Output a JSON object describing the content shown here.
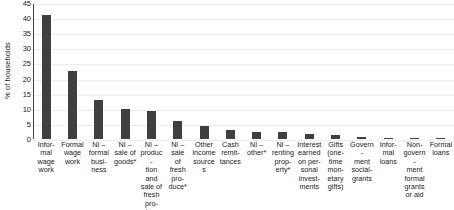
{
  "chart_data": {
    "type": "bar",
    "title": "",
    "xlabel": "",
    "ylabel": "% of households",
    "ylim": [
      0,
      45
    ],
    "yticks": [
      0,
      5,
      10,
      15,
      20,
      25,
      30,
      35,
      40,
      45
    ],
    "grid": true,
    "legend": "none",
    "bar_color": "#3f3f3f",
    "categories": [
      "Infor-\nmal\nwage\nwork",
      "Formal\nwage\nwork",
      "NI –\nformal\nbusi-\nness",
      "NI –\nsale of\ngoods*",
      "NI –\nproduc-\ntion\nand\nsale of\nfresh\npro-\nduce",
      "NI –\nsale\nof\nfresh\npro-\nduce*",
      "Other\nincome\nsources",
      "Cash\nremit-\ntances",
      "NI –\nother*",
      "NI –\nrenting\nprop-\nerty*",
      "Interest\nearned\non per-\nsonal\ninvest-\nments",
      "Gifts\n(one-\ntime\nmon-\netary\ngifts)",
      "Govern-\nment\nsocial-\ngrants",
      "Infor-\nmal\nloans",
      "Non-\ngovern-\nment\nformal\ngrants\nor aid",
      "Formal\nloans"
    ],
    "values": [
      41.5,
      23,
      13.2,
      10.2,
      9.6,
      6.4,
      4.7,
      3.2,
      2.6,
      2.5,
      2.0,
      1.5,
      1.1,
      0.8,
      0.7,
      0.7
    ]
  }
}
